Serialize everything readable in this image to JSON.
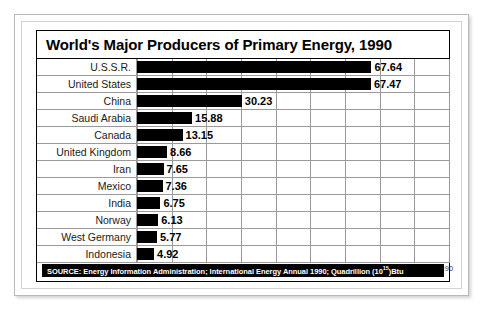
{
  "chart_data": {
    "type": "bar",
    "orientation": "horizontal",
    "title": "World's Major Producers of Primary Energy, 1990",
    "xlabel": "",
    "ylabel": "",
    "xlim": [
      0,
      90
    ],
    "grid": true,
    "legend": null,
    "xticks": [
      0,
      10,
      20,
      30,
      40,
      50,
      60,
      70,
      80,
      90
    ],
    "categories": [
      "U.S.S.R.",
      "United States",
      "China",
      "Saudi Arabia",
      "Canada",
      "United Kingdom",
      "Iran",
      "Mexico",
      "India",
      "Norway",
      "West Germany",
      "Indonesia"
    ],
    "values": [
      67.64,
      67.47,
      30.23,
      15.88,
      13.15,
      8.66,
      7.65,
      7.36,
      6.75,
      6.13,
      5.77,
      4.92
    ],
    "value_labels": [
      "67.64",
      "67.47",
      "30.23",
      "15.88",
      "13.15",
      "8.66",
      "7.65",
      "7.36",
      "6.75",
      "6.13",
      "5.77",
      "4.92"
    ],
    "bar_color": "#000000",
    "units": "Quadrillion (10^15) Btu"
  },
  "source": {
    "prefix": "SOURCE:",
    "text": "Energy Information Administration; International Energy Annual 1990; Quadrillion (10",
    "exponent": "15",
    "suffix": ")Btu"
  },
  "colors": {
    "bar": "#000000",
    "grid": "#9a9a9a",
    "frame": "#b9b9b9",
    "footer_bg": "#000000",
    "footer_text": "#ffffff"
  }
}
